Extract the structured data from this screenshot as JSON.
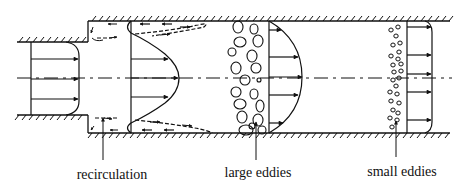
{
  "diagram": {
    "labels": {
      "recirculation": "recirculation",
      "large_eddies": "large eddies",
      "small_eddies": "small eddies"
    },
    "sections": [
      {
        "name": "inlet-profile",
        "description": "flat (plug) velocity profile in narrow pipe"
      },
      {
        "name": "expansion-profile",
        "description": "jet profile with recirculation zones near walls"
      },
      {
        "name": "large-eddies-profile",
        "description": "parabolic-like profile downstream of large eddies"
      },
      {
        "name": "small-eddies-profile",
        "description": "flat fully developed profile downstream of small eddies"
      }
    ],
    "colors": {
      "ink": "#111111",
      "background": "#ffffff"
    }
  }
}
